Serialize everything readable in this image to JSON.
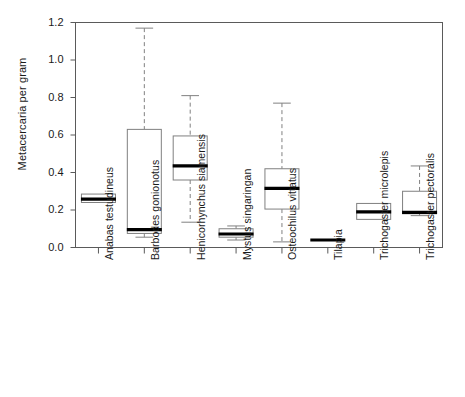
{
  "chart_data": {
    "type": "box",
    "title": "",
    "xlabel": "",
    "ylabel": "Metacercaria per gram",
    "ylim": [
      0.0,
      1.2
    ],
    "yticks": [
      0.0,
      0.2,
      0.4,
      0.6,
      0.8,
      1.0,
      1.2
    ],
    "ytick_labels": [
      "0.0",
      "0.2",
      "0.4",
      "0.6",
      "0.8",
      "1.0",
      "1.2"
    ],
    "grid": false,
    "legend": "none",
    "frame": "box",
    "categories": [
      "Anabas testudineus",
      "Barbodes gonionotus",
      "Henicorhynchus siamensis",
      "Mystus singaringan",
      "Osteochilus vittatus",
      "Tilapia",
      "Trichogaster microlepis",
      "Trichogaster pectoralis"
    ],
    "boxes": [
      {
        "category": "Anabas testudineus",
        "whisker_low": 0.24,
        "q1": 0.24,
        "median": 0.258,
        "q3": 0.285,
        "whisker_high": 0.285
      },
      {
        "category": "Barbodes gonionotus",
        "whisker_low": 0.055,
        "q1": 0.075,
        "median": 0.095,
        "q3": 0.63,
        "whisker_high": 1.17
      },
      {
        "category": "Henicorhynchus siamensis",
        "whisker_low": 0.135,
        "q1": 0.36,
        "median": 0.435,
        "q3": 0.595,
        "whisker_high": 0.81
      },
      {
        "category": "Mystus singaringan",
        "whisker_low": 0.04,
        "q1": 0.055,
        "median": 0.072,
        "q3": 0.1,
        "whisker_high": 0.115
      },
      {
        "category": "Osteochilus vittatus",
        "whisker_low": 0.03,
        "q1": 0.205,
        "median": 0.315,
        "q3": 0.42,
        "whisker_high": 0.77
      },
      {
        "category": "Tilapia",
        "whisker_low": 0.04,
        "q1": 0.04,
        "median": 0.04,
        "q3": 0.04,
        "whisker_high": 0.04
      },
      {
        "category": "Trichogaster microlepis",
        "whisker_low": 0.15,
        "q1": 0.15,
        "median": 0.19,
        "q3": 0.235,
        "whisker_high": 0.235
      },
      {
        "category": "Trichogaster pectoralis",
        "whisker_low": 0.17,
        "q1": 0.18,
        "median": 0.187,
        "q3": 0.3,
        "whisker_high": 0.435
      }
    ],
    "colors": {
      "box_edge": "#808080",
      "median": "#000000",
      "whisker": "#808080",
      "axis": "#5a5a5a",
      "text": "#1a1a1a",
      "background": "#ffffff"
    }
  }
}
